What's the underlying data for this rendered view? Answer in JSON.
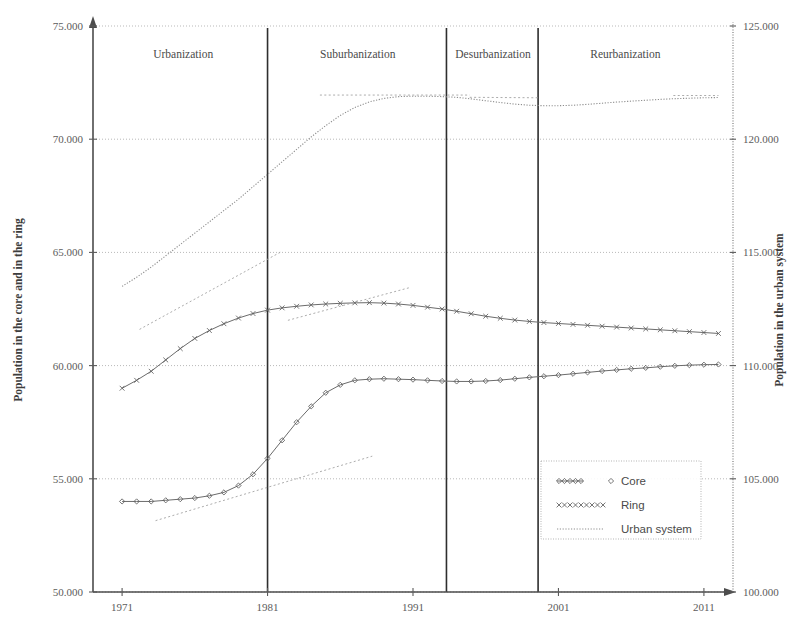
{
  "chart_data": {
    "type": "line",
    "title": "",
    "xlabel": "",
    "ylabel": "Population in the core and in the ring",
    "y2label": "Population in the urban system",
    "xlim": [
      1969,
      2013
    ],
    "ylim": [
      50000,
      75000
    ],
    "y2lim": [
      100000,
      125000
    ],
    "grid": true,
    "legend_position": "bottom-right",
    "x_ticks": [
      "1971",
      "1981",
      "1991",
      "2001",
      "2011"
    ],
    "x_tick_values": [
      1971,
      1981,
      1991,
      2001,
      2011
    ],
    "y_ticks": [
      "50.000",
      "55.000",
      "60.000",
      "65.000",
      "70.000",
      "75.000"
    ],
    "y_tick_values": [
      50000,
      55000,
      60000,
      65000,
      70000,
      75000
    ],
    "y2_ticks": [
      "100.000",
      "105.000",
      "110.000",
      "115.000",
      "120.000",
      "125.000"
    ],
    "y2_tick_values": [
      100000,
      105000,
      110000,
      115000,
      120000,
      125000
    ],
    "phases": [
      {
        "label": "Urbanization",
        "start": 1969,
        "end": 1981,
        "center": 1975.2
      },
      {
        "label": "Suburbanization",
        "start": 1981,
        "end": 1993.3,
        "center": 1987.2
      },
      {
        "label": "Desurbanization",
        "start": 1993.3,
        "end": 1999.6,
        "center": 1996.5
      },
      {
        "label": "Reurbanization",
        "start": 1999.6,
        "end": 2013,
        "center": 2005.6
      }
    ],
    "phase_dividers": [
      1981,
      1993.3,
      1999.6
    ],
    "x": [
      1971,
      1972,
      1973,
      1974,
      1975,
      1976,
      1977,
      1978,
      1979,
      1980,
      1981,
      1982,
      1983,
      1984,
      1985,
      1986,
      1987,
      1988,
      1989,
      1990,
      1991,
      1992,
      1993,
      1994,
      1995,
      1996,
      1997,
      1998,
      1999,
      2000,
      2001,
      2002,
      2003,
      2004,
      2005,
      2006,
      2007,
      2008,
      2009,
      2010,
      2011,
      2012
    ],
    "series": [
      {
        "name": "Core",
        "axis": "left",
        "marker": "diamond",
        "values": [
          54000,
          54000,
          54000,
          54050,
          54100,
          54150,
          54250,
          54400,
          54700,
          55200,
          55900,
          56700,
          57500,
          58200,
          58800,
          59150,
          59350,
          59400,
          59420,
          59400,
          59380,
          59350,
          59320,
          59300,
          59300,
          59320,
          59360,
          59420,
          59480,
          59530,
          59580,
          59640,
          59700,
          59760,
          59810,
          59860,
          59900,
          59950,
          59990,
          60020,
          60040,
          60050
        ]
      },
      {
        "name": "Ring",
        "axis": "left",
        "marker": "x",
        "values": [
          59000,
          59350,
          59750,
          60250,
          60750,
          61200,
          61550,
          61850,
          62100,
          62300,
          62450,
          62550,
          62620,
          62680,
          62720,
          62750,
          62770,
          62780,
          62760,
          62720,
          62660,
          62580,
          62500,
          62400,
          62290,
          62180,
          62090,
          62010,
          61950,
          61900,
          61860,
          61820,
          61780,
          61740,
          61700,
          61660,
          61620,
          61580,
          61540,
          61500,
          61460,
          61420
        ]
      },
      {
        "name": "Urban system",
        "axis": "right",
        "marker": "dotted",
        "values": [
          113500,
          113900,
          114350,
          114850,
          115350,
          115850,
          116350,
          116850,
          117350,
          117900,
          118450,
          119000,
          119550,
          120100,
          120600,
          121050,
          121400,
          121650,
          121800,
          121880,
          121900,
          121900,
          121880,
          121850,
          121780,
          121700,
          121620,
          121550,
          121500,
          121480,
          121480,
          121500,
          121540,
          121590,
          121640,
          121680,
          121720,
          121760,
          121790,
          121810,
          121830,
          121840
        ]
      }
    ],
    "trend_lines": [
      {
        "for": "Ring",
        "x0": 1972.2,
        "y0": 61600,
        "x1": 1982.0,
        "y1": 65050,
        "axis": "left"
      },
      {
        "for": "Ring",
        "x0": 1982.4,
        "y0": 62000,
        "x1": 1990.8,
        "y1": 63450,
        "axis": "left"
      },
      {
        "for": "Core",
        "x0": 1973.3,
        "y0": 53150,
        "x1": 1988.2,
        "y1": 56000,
        "axis": "left"
      },
      {
        "for": "Urban system",
        "x0": 1984.6,
        "y0": 121950,
        "x1": 1994.9,
        "y1": 121950,
        "axis": "right"
      },
      {
        "for": "Urban system",
        "x0": 1994.9,
        "y0": 121850,
        "x1": 1999.6,
        "y1": 121830,
        "axis": "right"
      },
      {
        "for": "Urban system",
        "x0": 2008.9,
        "y0": 121930,
        "x1": 2012.0,
        "y1": 121930,
        "axis": "right"
      }
    ],
    "legend": [
      {
        "label": "Core",
        "marker": "diamond"
      },
      {
        "label": "Ring",
        "marker": "x"
      },
      {
        "label": "Urban system",
        "marker": "dotted"
      }
    ]
  }
}
